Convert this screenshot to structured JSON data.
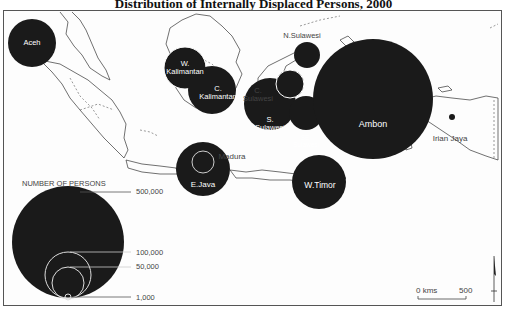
{
  "title": "Distribution of Internally Displaced Persons, 2000",
  "regions": [
    {
      "name": "Aceh",
      "cx": 32,
      "cy": 43,
      "r": 24
    },
    {
      "name": "W. Kalimantan",
      "cx": 185,
      "cy": 68,
      "r": 21
    },
    {
      "name": "C. Kalimantan",
      "cx": 212,
      "cy": 90,
      "r": 24
    },
    {
      "name": "C. Sulawesi",
      "cx": 290,
      "cy": 83,
      "r": 14
    },
    {
      "name": "N.Sulawesi",
      "cx": 307,
      "cy": 55,
      "r": 14
    },
    {
      "name": "S. Sulawesi",
      "cx": 270,
      "cy": 104,
      "r": 26
    },
    {
      "name": "SE. Sulawesi",
      "cx": 306,
      "cy": 112,
      "r": 17
    },
    {
      "name": "Ambon",
      "cx": 372,
      "cy": 97,
      "r": 60
    },
    {
      "name": "E.Java",
      "cx": 203,
      "cy": 169,
      "r": 27
    },
    {
      "name": "W.Timor",
      "cx": 319,
      "cy": 182,
      "r": 27
    },
    {
      "name": "Irian Jaya",
      "cx": 452,
      "cy": 116,
      "r": 3
    }
  ],
  "labels": {
    "aceh": "Aceh",
    "w_kal_1": "W.",
    "w_kal_2": "Kalimantan",
    "c_kal_1": "C.",
    "c_kal_2": "Kalimantan",
    "c_sul_1": "C.",
    "c_sul_2": "Sulawesi",
    "n_sul": "N.Sulawesi",
    "s_sul_1": "S.",
    "s_sul_2": "Sulawesi",
    "se_sul_1": "SE.",
    "se_sul_2": "Sulawesi",
    "ambon": "Ambon",
    "irian": "Irian Jaya",
    "madura": "Madura",
    "ejava": "E.Java",
    "wtimor": "W.Timor"
  },
  "legend": {
    "title": "NUMBER OF PERSONS",
    "entries": [
      "500,000",
      "100,000",
      "50,000",
      "1,000"
    ]
  },
  "scale": {
    "zero": "0 kms",
    "max": "500"
  }
}
